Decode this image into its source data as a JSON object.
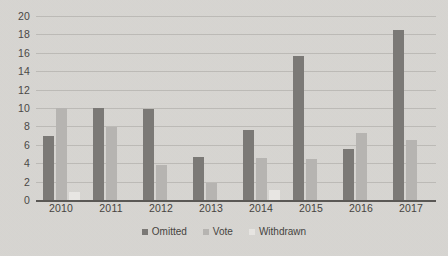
{
  "chart_data": {
    "type": "bar",
    "title": "",
    "xlabel": "",
    "ylabel": "",
    "ylim": [
      0,
      20
    ],
    "ytick_step": 2,
    "yticks": [
      "20",
      "18",
      "16",
      "14",
      "12",
      "10",
      "8",
      "6",
      "4",
      "2",
      "0"
    ],
    "grid": true,
    "legend_position": "bottom",
    "categories": [
      "2010",
      "2011",
      "2012",
      "2013",
      "2014",
      "2015",
      "2016",
      "2017"
    ],
    "series": [
      {
        "name": "Omitted",
        "color": "#7b7976",
        "values": [
          7,
          10,
          9.9,
          4.7,
          7.6,
          15.7,
          5.5,
          18.5
        ]
      },
      {
        "name": "Vote",
        "color": "#b6b4b1",
        "values": [
          10,
          7.9,
          3.8,
          1.8,
          4.6,
          4.5,
          7.3,
          6.5
        ]
      },
      {
        "name": "Withdrawn",
        "color": "#e8e6e3",
        "values": [
          0.9,
          0,
          0,
          0,
          1.1,
          0,
          0,
          0
        ]
      }
    ]
  },
  "colors": {
    "background": "#d9d7d3",
    "gridline": "#bcbab6",
    "axis": "#5a5855",
    "text": "#46443f"
  }
}
